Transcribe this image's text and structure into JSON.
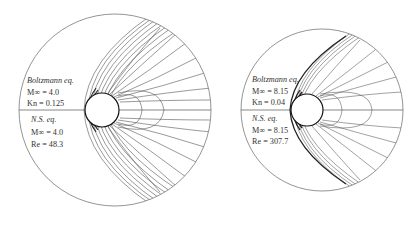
{
  "panels": [
    {
      "id": "left",
      "upper": {
        "title": "Boltzmann eq.",
        "mach_label": "M∞ = 4.0",
        "param_label": "Kn = 0.125"
      },
      "lower": {
        "title": "N.S. eq.",
        "mach_label": "M∞ = 4.0",
        "param_label": "Re = 48.3"
      }
    },
    {
      "id": "right",
      "upper": {
        "title": "Boltzmann eq.",
        "mach_label": "M∞ = 8.15",
        "param_label": "Kn = 0.04"
      },
      "lower": {
        "title": "N.S. eq.",
        "mach_label": "M∞ = 8.15",
        "param_label": "Re = 307.7"
      }
    }
  ],
  "colors": {
    "line": "#555555",
    "ink": "#222222",
    "background": "#ffffff"
  }
}
